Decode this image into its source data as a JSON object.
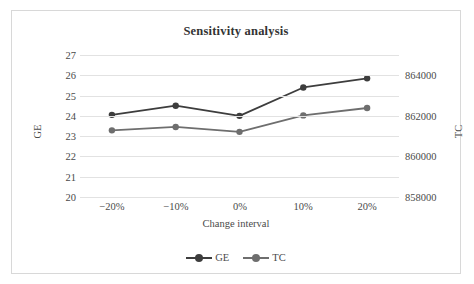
{
  "chart_data": {
    "type": "line",
    "title": "Sensitivity analysis",
    "xlabel": "Change interval",
    "categories": [
      "−20%",
      "−10%",
      "0%",
      "10%",
      "20%"
    ],
    "grid": true,
    "legend_position": "bottom",
    "series": [
      {
        "name": "GE",
        "axis": "left",
        "color": "#3d3d3d",
        "values": [
          24.05,
          24.5,
          24.0,
          25.4,
          25.85
        ]
      },
      {
        "name": "TC",
        "axis": "right",
        "color": "#6e6e6e",
        "values": [
          860520,
          860700,
          860440,
          861310,
          861700
        ]
      }
    ],
    "left_axis": {
      "label": "GE",
      "ylim": [
        20,
        27
      ],
      "ticks": [
        "20",
        "21",
        "22",
        "23",
        "24",
        "25",
        "26",
        "27"
      ]
    },
    "right_axis": {
      "label": "TC",
      "ylim": [
        857000,
        864500
      ],
      "ticks": [
        "858000",
        "860000",
        "862000",
        "864000"
      ]
    },
    "legend": [
      {
        "label": "GE",
        "color": "#3d3d3d"
      },
      {
        "label": "TC",
        "color": "#6e6e6e"
      }
    ]
  }
}
